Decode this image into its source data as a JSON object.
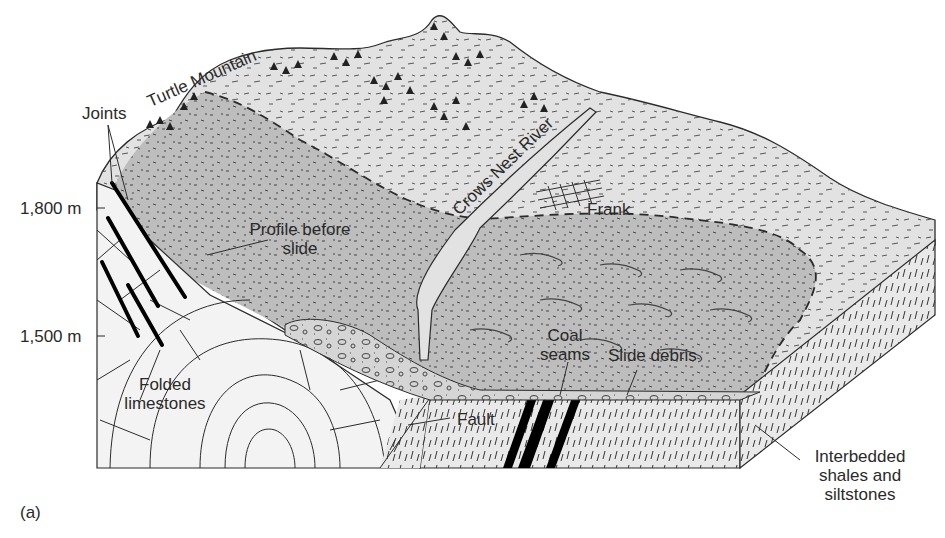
{
  "figure": {
    "panel_label": "(a)",
    "colors": {
      "background": "#ffffff",
      "line": "#2b2b2b",
      "upper_surface": "#e2e2e2",
      "slide_area": "#bdbdbd",
      "limestone": "#f3f3f3",
      "shale": "#e9e9e9",
      "coal": "#000000"
    }
  },
  "elevation_axis": {
    "ticks": [
      {
        "label": "1,800 m"
      },
      {
        "label": "1,500 m"
      }
    ]
  },
  "labels": {
    "turtle_mountain": "Turtle Mountain",
    "joints": "Joints",
    "crows_nest_river": "Crows Nest River",
    "frank": "Frank",
    "profile_before_slide_line1": "Profile before",
    "profile_before_slide_line2": "slide",
    "folded_limestones_line1": "Folded",
    "folded_limestones_line2": "limestones",
    "coal_seams_line1": "Coal",
    "coal_seams_line2": "seams",
    "slide_debris": "Slide debris",
    "fault": "Fault",
    "interbedded_line1": "Interbedded",
    "interbedded_line2": "shales and",
    "interbedded_line3": "siltstones"
  }
}
